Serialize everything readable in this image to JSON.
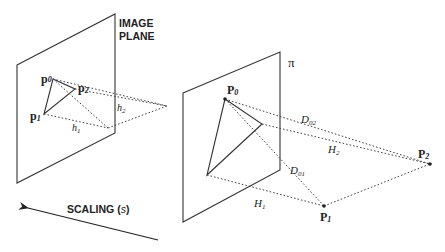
{
  "labels": {
    "image_plane_line1": "IMAGE",
    "image_plane_line2": "PLANE",
    "pi": "π",
    "p0": "p",
    "p0_sub": "0",
    "p1": "p",
    "p1_sub": "1",
    "p2": "p",
    "p2_sub": "2",
    "h1": "h",
    "h1_sub": "1",
    "h2": "h",
    "h2_sub": "2",
    "P0": "P",
    "P0_sub": "0",
    "P1": "P",
    "P1_sub": "1",
    "P2": "P",
    "P2_sub": "2",
    "D01": "D",
    "D01_sub": "01",
    "D02": "D",
    "D02_sub": "02",
    "H1": "H",
    "H1_sub": "1",
    "H2": "H",
    "H2_sub": "2",
    "scaling": "SCALING (",
    "scaling_var": "s",
    "scaling_close": ")"
  }
}
